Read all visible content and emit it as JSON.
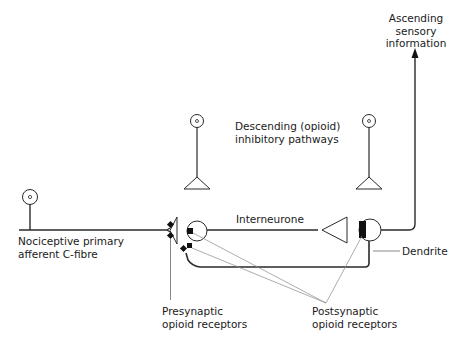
{
  "diagram": {
    "colors": {
      "stroke": "#2a2a2a",
      "leader": "#8a8a8a",
      "fill_receptor": "#111111"
    },
    "labels": {
      "ascending": [
        "Ascending",
        "sensory",
        "information"
      ],
      "descending": [
        "Descending (opioid)",
        "inhibitory pathways"
      ],
      "interneurone": "Interneurone",
      "c_fibre": [
        "Nociceptive primary",
        "afferent C-fibre"
      ],
      "dendrite": "Dendrite",
      "presynaptic": [
        "Presynaptic",
        "opioid receptors"
      ],
      "postsynaptic": [
        "Postsynaptic",
        "opioid receptors"
      ]
    },
    "nodes": [
      {
        "id": "c-fibre-cell",
        "type": "neuron-body"
      },
      {
        "id": "descending-neuron-left",
        "type": "neuron-terminal"
      },
      {
        "id": "descending-neuron-right",
        "type": "neuron-terminal"
      },
      {
        "id": "interneurone",
        "type": "neuron"
      },
      {
        "id": "projection-neuron",
        "type": "neuron"
      }
    ],
    "edges": [
      {
        "from": "c-fibre-cell",
        "to": "presynaptic-terminal"
      },
      {
        "from": "interneurone",
        "to": "projection-neuron"
      },
      {
        "from": "projection-neuron",
        "to": "ascending",
        "arrow": true
      },
      {
        "from": "projection-neuron",
        "to": "dendrite-loop"
      }
    ]
  }
}
